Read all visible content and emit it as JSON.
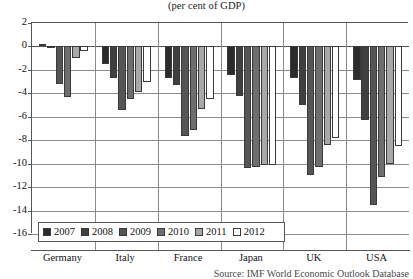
{
  "chart_data": {
    "type": "bar",
    "title": "",
    "subtitle": "(per cent of GDP)",
    "xlabel": "",
    "ylabel": "",
    "ylim": [
      -16,
      2
    ],
    "ytick_step": 2,
    "yticks": [
      "2",
      "0",
      "-2",
      "-4",
      "-6",
      "-8",
      "-10",
      "-12",
      "-14",
      "-16"
    ],
    "grid": true,
    "legend_position": "bottom-left-inside",
    "categories": [
      "Germany",
      "Italy",
      "France",
      "Japan",
      "UK",
      "USA"
    ],
    "series": [
      {
        "name": "2007",
        "color": "#2b2b2b",
        "values": [
          0.2,
          -1.5,
          -2.7,
          -2.4,
          -2.7,
          -2.9
        ]
      },
      {
        "name": "2008",
        "color": "#3f3f3f",
        "values": [
          -0.1,
          -2.7,
          -3.3,
          -4.2,
          -5.0,
          -6.3
        ]
      },
      {
        "name": "2009",
        "color": "#555555",
        "values": [
          -3.2,
          -5.4,
          -7.6,
          -10.4,
          -11.0,
          -13.5
        ]
      },
      {
        "name": "2010",
        "color": "#6e6e6e",
        "values": [
          -4.3,
          -4.5,
          -7.1,
          -10.3,
          -10.3,
          -11.1
        ]
      },
      {
        "name": "2011",
        "color": "#a8a8a8",
        "values": [
          -1.0,
          -3.9,
          -5.3,
          -10.1,
          -8.4,
          -10.0
        ]
      },
      {
        "name": "2012",
        "color": "#ffffff",
        "values": [
          -0.4,
          -3.0,
          -4.5,
          -10.1,
          -7.8,
          -8.5
        ]
      }
    ]
  },
  "header": {
    "title_cropped": "",
    "subtitle": "(per cent of GDP)"
  },
  "footer": {
    "source": "Source: IMF World Economic Outlook Database"
  },
  "legend": {
    "items": [
      {
        "label": "2007"
      },
      {
        "label": "2008"
      },
      {
        "label": "2009"
      },
      {
        "label": "2010"
      },
      {
        "label": "2011"
      },
      {
        "label": "2012"
      }
    ]
  }
}
